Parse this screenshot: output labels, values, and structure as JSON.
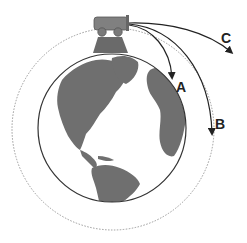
{
  "diagram": {
    "colors": {
      "land": "#6f6f6f",
      "ocean": "#ffffff",
      "earth_outline": "#333333",
      "orbit": "#9a9a9a",
      "cannon": "#777777",
      "trajectory": "#222222"
    },
    "trajectories": [
      {
        "id": "A",
        "label": "A",
        "description": "falls to Earth nearby"
      },
      {
        "id": "B",
        "label": "B",
        "description": "circular orbit"
      },
      {
        "id": "C",
        "label": "C",
        "description": "escapes"
      }
    ],
    "icons": {
      "cannon": "cannon-icon",
      "earth": "earth-globe-icon"
    }
  }
}
